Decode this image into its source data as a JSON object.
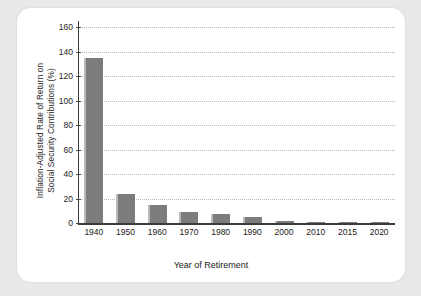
{
  "chart_data": {
    "type": "bar",
    "title": "",
    "xlabel": "Year of Retirement",
    "ylabel": "Inflation-Adjusted Rate of Return on Social Security Contributions (%)",
    "ylabel_line1": "Inflation-Adjusted Rate of Return on",
    "ylabel_line2": "Social Security Contributions (%)",
    "categories": [
      "1940",
      "1950",
      "1960",
      "1970",
      "1980",
      "1990",
      "2000",
      "2010",
      "2015",
      "2020"
    ],
    "values": [
      135,
      23.5,
      14.5,
      9,
      7,
      5,
      2,
      0.6,
      0.2,
      0.1
    ],
    "ylim": [
      0,
      165
    ],
    "yticks": [
      0,
      20,
      40,
      60,
      80,
      100,
      120,
      140,
      160
    ],
    "ytick_labels": [
      "0",
      "20",
      "40",
      "60",
      "80",
      "100",
      "120",
      "140",
      "160"
    ],
    "grid": "horizontal-dotted",
    "legend": "none",
    "bar_color": "#7c7c7c",
    "bar_highlight_color": "#b9b9b9",
    "axis_color": "#3b3b3b",
    "grid_color": "#b9b9b9",
    "panel_color": "#ffffff",
    "page_background": "#e9e9e9"
  }
}
